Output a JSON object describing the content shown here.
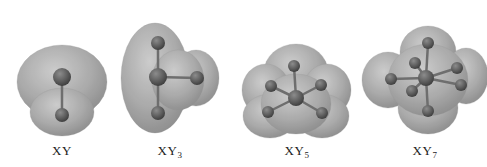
{
  "figure": {
    "molecules": [
      {
        "id": "xy",
        "formula_base": "XY",
        "subscript": "",
        "label_x": 62,
        "center_atom": {
          "x": 62,
          "y": 77,
          "r": 9
        },
        "ligands": [
          {
            "x": 62,
            "y": 115,
            "r": 7
          }
        ],
        "surface": [
          {
            "cx": 62,
            "cy": 82,
            "rx": 45,
            "ry": 37
          },
          {
            "cx": 62,
            "cy": 112,
            "rx": 32,
            "ry": 24
          }
        ]
      },
      {
        "id": "xy3",
        "formula_base": "XY",
        "subscript": "3",
        "label_x": 170,
        "center_atom": {
          "x": 158,
          "y": 77,
          "r": 9
        },
        "ligands": [
          {
            "x": 158,
            "y": 43,
            "r": 7
          },
          {
            "x": 197,
            "y": 78,
            "r": 7
          },
          {
            "x": 158,
            "y": 113,
            "r": 7
          }
        ],
        "surface": [
          {
            "cx": 155,
            "cy": 78,
            "rx": 34,
            "ry": 55
          },
          {
            "cx": 196,
            "cy": 78,
            "rx": 23,
            "ry": 28
          },
          {
            "cx": 178,
            "cy": 80,
            "rx": 26,
            "ry": 30
          }
        ]
      },
      {
        "id": "xy5",
        "formula_base": "XY",
        "subscript": "5",
        "label_x": 297,
        "center_atom": {
          "x": 296,
          "y": 98,
          "r": 8
        },
        "ligands": [
          {
            "x": 294,
            "y": 66,
            "r": 6
          },
          {
            "x": 271,
            "y": 86,
            "r": 6
          },
          {
            "x": 321,
            "y": 85,
            "r": 6
          },
          {
            "x": 268,
            "y": 112,
            "r": 6
          },
          {
            "x": 322,
            "y": 113,
            "r": 6
          }
        ],
        "surface": [
          {
            "cx": 296,
            "cy": 72,
            "rx": 32,
            "ry": 28
          },
          {
            "cx": 266,
            "cy": 90,
            "rx": 24,
            "ry": 26
          },
          {
            "cx": 327,
            "cy": 90,
            "rx": 24,
            "ry": 26
          },
          {
            "cx": 270,
            "cy": 116,
            "rx": 27,
            "ry": 22
          },
          {
            "cx": 322,
            "cy": 116,
            "rx": 27,
            "ry": 22
          },
          {
            "cx": 296,
            "cy": 104,
            "rx": 35,
            "ry": 30
          }
        ]
      },
      {
        "id": "xy7",
        "formula_base": "XY",
        "subscript": "7",
        "label_x": 425,
        "center_atom": {
          "x": 426,
          "y": 78,
          "r": 8
        },
        "ligands": [
          {
            "x": 428,
            "y": 43,
            "r": 6
          },
          {
            "x": 391,
            "y": 79,
            "r": 6
          },
          {
            "x": 415,
            "y": 63,
            "r": 6
          },
          {
            "x": 457,
            "y": 68,
            "r": 6
          },
          {
            "x": 461,
            "y": 85,
            "r": 6
          },
          {
            "x": 412,
            "y": 91,
            "r": 6
          },
          {
            "x": 428,
            "y": 111,
            "r": 6
          }
        ],
        "surface": [
          {
            "cx": 428,
            "cy": 52,
            "rx": 28,
            "ry": 26
          },
          {
            "cx": 388,
            "cy": 80,
            "rx": 26,
            "ry": 28
          },
          {
            "cx": 466,
            "cy": 76,
            "rx": 22,
            "ry": 28
          },
          {
            "cx": 428,
            "cy": 108,
            "rx": 30,
            "ry": 26
          },
          {
            "cx": 428,
            "cy": 80,
            "rx": 40,
            "ry": 36
          }
        ]
      }
    ]
  },
  "colors": {
    "background": "#ffffff",
    "surface": "#9a9a9a",
    "surface_highlight": "#c4c4c4",
    "atom": "#5c5c5c",
    "atom_highlight": "#8a8a8a",
    "bond": "#6e6e6e",
    "label": "#222222"
  }
}
